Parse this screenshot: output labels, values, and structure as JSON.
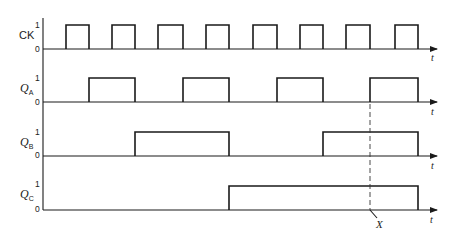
{
  "diagram": {
    "type": "timing-diagram",
    "time_axis_label": "t",
    "level_high_label": "1",
    "level_low_label": "0",
    "signals": [
      {
        "id": "ck",
        "label": "CK",
        "subscript": "",
        "high_y": 25,
        "low_y": 49,
        "pulses": [
          [
            66,
            89
          ],
          [
            112,
            135
          ],
          [
            158,
            183
          ],
          [
            206,
            229
          ],
          [
            253,
            277
          ],
          [
            300,
            323
          ],
          [
            346,
            370
          ],
          [
            395,
            418
          ]
        ]
      },
      {
        "id": "qa",
        "label": "Q",
        "subscript": "A",
        "high_y": 78,
        "low_y": 102,
        "pulses": [
          [
            89,
            135
          ],
          [
            183,
            229
          ],
          [
            277,
            323
          ],
          [
            370,
            418
          ]
        ]
      },
      {
        "id": "qb",
        "label": "Q",
        "subscript": "B",
        "high_y": 132,
        "low_y": 156,
        "pulses": [
          [
            135,
            229
          ],
          [
            323,
            418
          ]
        ]
      },
      {
        "id": "qc",
        "label": "Q",
        "subscript": "C",
        "high_y": 186,
        "low_y": 210,
        "pulses": [
          [
            229,
            418
          ]
        ]
      }
    ],
    "marker": {
      "label": "X",
      "x": 370,
      "y_top": 104,
      "y_bottom": 210
    }
  }
}
